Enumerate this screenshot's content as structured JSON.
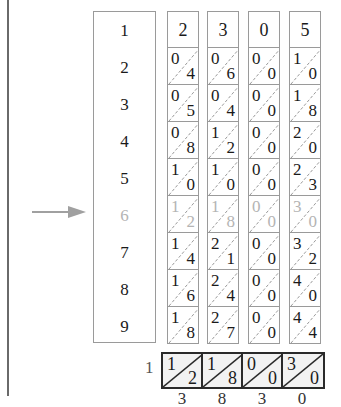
{
  "diagram": {
    "type": "napiers-bones",
    "multiplicand_digits": [
      "2",
      "3",
      "0",
      "5"
    ],
    "index_rows": [
      "1",
      "2",
      "3",
      "4",
      "5",
      "6",
      "7",
      "8",
      "9"
    ],
    "selected_row": "6",
    "rods": [
      {
        "head": "2",
        "cells": [
          {
            "t": "0",
            "o": "4"
          },
          {
            "t": "0",
            "o": "5"
          },
          {
            "t": "0",
            "o": "8"
          },
          {
            "t": "1",
            "o": "0"
          },
          {
            "t": "1",
            "o": "2"
          },
          {
            "t": "1",
            "o": "4"
          },
          {
            "t": "1",
            "o": "6"
          },
          {
            "t": "1",
            "o": "8"
          }
        ]
      },
      {
        "head": "3",
        "cells": [
          {
            "t": "0",
            "o": "6"
          },
          {
            "t": "0",
            "o": "4"
          },
          {
            "t": "1",
            "o": "2"
          },
          {
            "t": "1",
            "o": "0"
          },
          {
            "t": "1",
            "o": "8"
          },
          {
            "t": "2",
            "o": "1"
          },
          {
            "t": "2",
            "o": "4"
          },
          {
            "t": "2",
            "o": "7"
          }
        ]
      },
      {
        "head": "0",
        "cells": [
          {
            "t": "0",
            "o": "0"
          },
          {
            "t": "0",
            "o": "0"
          },
          {
            "t": "0",
            "o": "0"
          },
          {
            "t": "0",
            "o": "0"
          },
          {
            "t": "0",
            "o": "0"
          },
          {
            "t": "0",
            "o": "0"
          },
          {
            "t": "0",
            "o": "0"
          },
          {
            "t": "0",
            "o": "0"
          }
        ]
      },
      {
        "head": "5",
        "cells": [
          {
            "t": "1",
            "o": "0"
          },
          {
            "t": "1",
            "o": "8"
          },
          {
            "t": "2",
            "o": "0"
          },
          {
            "t": "2",
            "o": "3"
          },
          {
            "t": "3",
            "o": "0"
          },
          {
            "t": "3",
            "o": "2"
          },
          {
            "t": "4",
            "o": "0"
          },
          {
            "t": "4",
            "o": "4"
          }
        ]
      }
    ],
    "result_row": {
      "label": "1",
      "cells": [
        {
          "t": "1",
          "o": "2"
        },
        {
          "t": "1",
          "o": "8"
        },
        {
          "t": "0",
          "o": "0"
        },
        {
          "t": "3",
          "o": "0"
        }
      ],
      "sums": [
        "3",
        "8",
        "3",
        "0"
      ]
    },
    "colors": {
      "line": "#9a9a9a",
      "text": "#1a1a1a",
      "dimmed": "#b4b4b4",
      "result_border": "#2a2a2a",
      "result_fill": "#f2f2f2",
      "arrow": "#a0a0a0"
    }
  }
}
